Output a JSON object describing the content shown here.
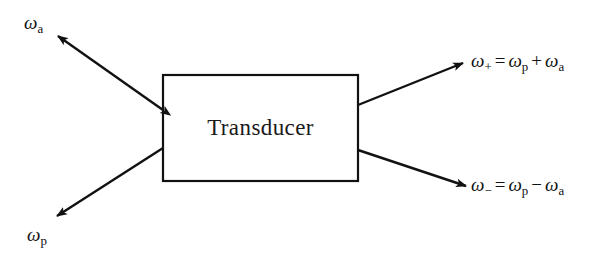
{
  "diagram": {
    "background_color": "#ffffff",
    "stroke_color": "#111111",
    "box": {
      "label": "Transducer",
      "x": 163,
      "y": 75,
      "width": 195,
      "height": 106,
      "border_width": 2.2
    },
    "arrows": [
      {
        "name": "arrow-omega-a",
        "heads": "both",
        "from": [
          163,
          110
        ],
        "to": [
          58,
          36
        ],
        "description": "double-headed arrow between box left edge and omega-a label"
      },
      {
        "name": "arrow-omega-p",
        "heads": "end",
        "from": [
          163,
          148
        ],
        "to": [
          57,
          216
        ],
        "description": "arrow from box left edge down-left to omega-p label"
      },
      {
        "name": "arrow-omega-plus",
        "heads": "end",
        "from": [
          358,
          105
        ],
        "to": [
          463,
          63
        ],
        "description": "arrow from box right edge up-right to sum frequency label"
      },
      {
        "name": "arrow-omega-minus",
        "heads": "end",
        "from": [
          358,
          150
        ],
        "to": [
          466,
          186
        ],
        "description": "arrow from box right edge down-right to difference frequency label"
      }
    ],
    "labels": {
      "omega_a": {
        "symbol": "ω",
        "sub": "a"
      },
      "omega_p": {
        "symbol": "ω",
        "sub": "p"
      },
      "omega_plus": {
        "lhs_symbol": "ω",
        "lhs_sub": "+",
        "equals": "=",
        "term1_symbol": "ω",
        "term1_sub": "p",
        "operator": "+",
        "term2_symbol": "ω",
        "term2_sub": "a",
        "text": "ω₊ = ωₚ + ωₐ"
      },
      "omega_minus": {
        "lhs_symbol": "ω",
        "lhs_sub": "−",
        "equals": "=",
        "term1_symbol": "ω",
        "term1_sub": "p",
        "operator": "−",
        "term2_symbol": "ω",
        "term2_sub": "a",
        "text": "ω₋ = ωₚ − ωₐ"
      }
    }
  }
}
